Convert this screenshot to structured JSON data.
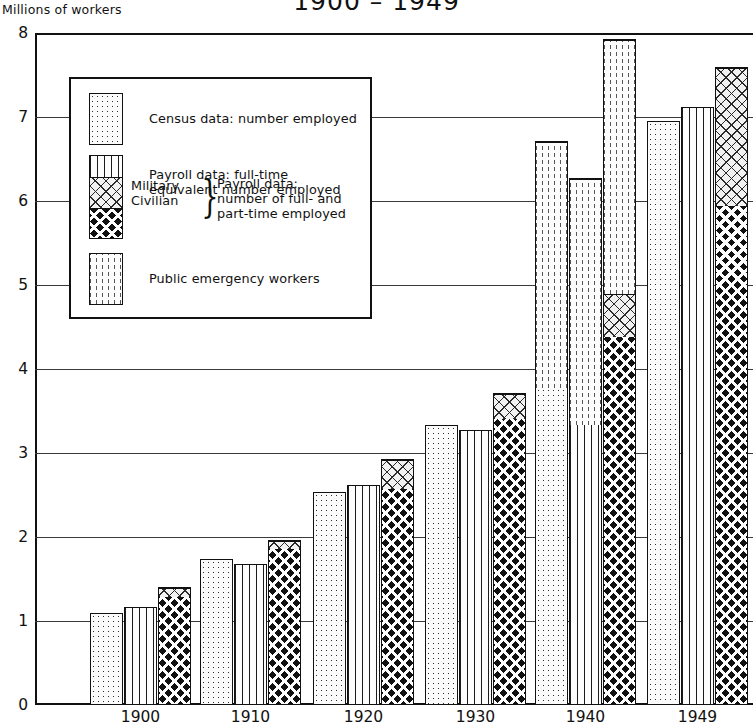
{
  "chart": {
    "title": "1900 – 1949",
    "y_axis_title": "Millions of workers"
  },
  "chart_data": {
    "type": "bar",
    "title": "1900 – 1949",
    "xlabel": "",
    "ylabel": "Millions of workers",
    "ylim": [
      0,
      8
    ],
    "yticks": [
      "0",
      "1",
      "2",
      "3",
      "4",
      "5",
      "6",
      "7",
      "8"
    ],
    "grid": true,
    "legend_position": "upper-left inset",
    "categories": [
      "1900",
      "1910",
      "1920",
      "1930",
      "1940",
      "1949"
    ],
    "grouping": "three bars per year; bar 3 is stacked (Civilian + Military); public emergency workers stack on top of bars in 1940",
    "series": [
      {
        "name": "Census data: number employed",
        "pattern": "dotted",
        "values": [
          1.09,
          1.74,
          2.54,
          3.33,
          3.78,
          6.95
        ]
      },
      {
        "name": "Payroll data: full-time equivalent number employed",
        "pattern": "vertical-lines",
        "values": [
          1.17,
          1.68,
          2.62,
          3.27,
          3.34,
          7.12
        ]
      },
      {
        "name": "Civilian",
        "pattern": "dense-crosshatch",
        "values": [
          1.3,
          1.87,
          2.58,
          3.42,
          4.38,
          5.95
        ]
      },
      {
        "name": "Military",
        "pattern": "light-crosshatch",
        "values": [
          0.11,
          0.09,
          0.35,
          0.29,
          0.52,
          1.65
        ]
      },
      {
        "name": "Public emergency workers",
        "pattern": "dashed-vertical",
        "values": [
          0.0,
          0.0,
          0.0,
          0.0,
          0.0,
          0.0
        ],
        "values_by_bar_1940": [
          2.93,
          2.93,
          3.03
        ]
      }
    ],
    "bar_totals": {
      "1900": [
        1.09,
        1.17,
        1.41
      ],
      "1910": [
        1.74,
        1.68,
        1.96
      ],
      "1920": [
        2.54,
        2.62,
        2.93
      ],
      "1930": [
        3.33,
        3.27,
        3.71
      ],
      "1940": [
        6.71,
        6.27,
        7.93
      ],
      "1949": [
        6.95,
        7.12,
        7.6
      ]
    }
  },
  "legend": {
    "items": [
      {
        "label": "Census data: number employed",
        "pattern": "dotted"
      },
      {
        "label_line1": "Payroll data: full-time",
        "label_line2": "equivalent number employed",
        "pattern": "vertical-lines"
      },
      {
        "label_military": "Military",
        "label_civilian": "Civilian",
        "brace": "}",
        "desc_line1": "Payroll data:",
        "desc_line2": "number of full- and",
        "desc_line3": "part-time employed"
      },
      {
        "label": "Public emergency workers",
        "pattern": "dashed-vertical"
      }
    ]
  }
}
